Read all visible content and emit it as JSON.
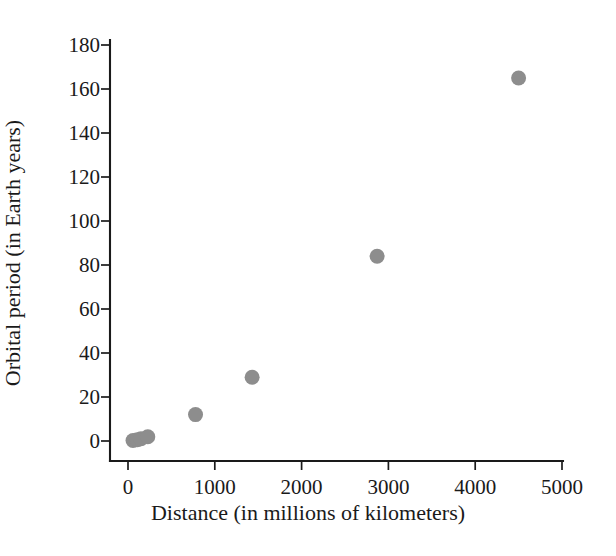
{
  "chart_data": {
    "type": "scatter",
    "title": "",
    "xlabel": "Distance (in millions of kilometers)",
    "ylabel": "Orbital period (in Earth years)",
    "xlim": [
      0,
      5000
    ],
    "ylim": [
      0,
      180
    ],
    "grid": false,
    "legend": "none",
    "marker_color": "#8d8d8d",
    "xticks": [
      0,
      1000,
      2000,
      3000,
      4000,
      5000
    ],
    "yticks": [
      0,
      20,
      40,
      60,
      80,
      100,
      120,
      140,
      160,
      180
    ],
    "xtick_labels": [
      "0",
      "1000",
      "2000",
      "3000",
      "4000",
      "5000"
    ],
    "ytick_labels": [
      "0",
      "20",
      "40",
      "60",
      "80",
      "100",
      "120",
      "140",
      "160",
      "180"
    ],
    "points": [
      {
        "x": 58,
        "y": 0.2
      },
      {
        "x": 108,
        "y": 0.6
      },
      {
        "x": 150,
        "y": 1
      },
      {
        "x": 228,
        "y": 1.9
      },
      {
        "x": 778,
        "y": 12
      },
      {
        "x": 1430,
        "y": 29
      },
      {
        "x": 2870,
        "y": 84
      },
      {
        "x": 4500,
        "y": 165
      }
    ]
  }
}
